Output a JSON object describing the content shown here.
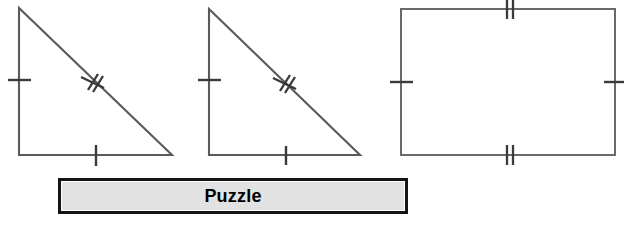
{
  "canvas": {
    "width": 624,
    "height": 236,
    "background": "#ffffff",
    "stroke_color": "#5a5a5a",
    "tick_color": "#3a3a3a"
  },
  "label": {
    "text": "Puzzle",
    "background": "#e2e2e2",
    "border_color": "#141414",
    "text_color": "#000000"
  },
  "figures": [
    {
      "name": "right-triangle-1",
      "shape": "right-triangle",
      "orientation": "right-angle-bottom-left",
      "vertices": [
        [
          19,
          8
        ],
        [
          19,
          155
        ],
        [
          172,
          155
        ]
      ],
      "marks": [
        {
          "edge": "left-leg",
          "ticks": 1,
          "style": "horizontal-bar",
          "position": [
            19,
            80
          ]
        },
        {
          "edge": "bottom-leg",
          "ticks": 1,
          "style": "vertical-bar",
          "position": [
            96,
            155
          ]
        },
        {
          "edge": "hypotenuse",
          "ticks": 2,
          "style": "perpendicular-double",
          "position": [
            94,
            82
          ]
        }
      ]
    },
    {
      "name": "right-triangle-2",
      "shape": "right-triangle",
      "orientation": "right-angle-bottom-left",
      "vertices": [
        [
          209,
          9
        ],
        [
          209,
          155
        ],
        [
          360,
          155
        ]
      ],
      "marks": [
        {
          "edge": "left-leg",
          "ticks": 1,
          "style": "horizontal-bar",
          "position": [
            209,
            80
          ]
        },
        {
          "edge": "bottom-leg",
          "ticks": 1,
          "style": "vertical-bar",
          "position": [
            286,
            155
          ]
        },
        {
          "edge": "hypotenuse",
          "ticks": 2,
          "style": "perpendicular-double",
          "position": [
            286,
            83
          ]
        }
      ]
    },
    {
      "name": "rectangle",
      "shape": "rectangle",
      "bounds": {
        "x": 401,
        "y": 9,
        "width": 214,
        "height": 146
      },
      "marks": [
        {
          "edge": "top",
          "ticks": 2,
          "style": "vertical-double",
          "position": [
            510,
            9
          ]
        },
        {
          "edge": "bottom",
          "ticks": 2,
          "style": "vertical-double",
          "position": [
            510,
            155
          ]
        },
        {
          "edge": "left",
          "ticks": 1,
          "style": "horizontal-bar",
          "position": [
            401,
            82
          ]
        },
        {
          "edge": "right",
          "ticks": 1,
          "style": "horizontal-bar",
          "position": [
            615,
            82
          ]
        }
      ]
    }
  ]
}
